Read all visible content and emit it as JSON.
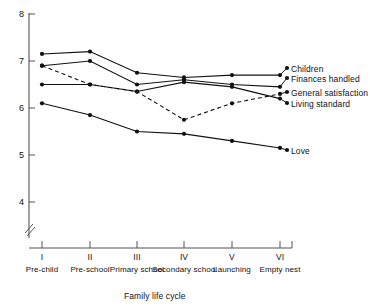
{
  "chart_data": {
    "type": "line",
    "title": "",
    "xlabel": "Family life cycle",
    "ylabel": "",
    "grid": false,
    "legend_position": "right-inline",
    "ylim": [
      3.7,
      8.1
    ],
    "yticks": [
      "8",
      "7",
      "6",
      "5",
      "4"
    ],
    "ytick_values": [
      8,
      7,
      6,
      5,
      4
    ],
    "y_axis_break": true,
    "x_axis_break": true,
    "categories": [
      "I",
      "II",
      "III",
      "IV",
      "V",
      "VI"
    ],
    "category_labels": [
      "Pre-child",
      "Pre-school",
      "Primary school",
      "Secondary school",
      "Launching",
      "Empty nest"
    ],
    "series": [
      {
        "name": "Children",
        "style": "solid",
        "values": [
          7.15,
          7.2,
          6.75,
          6.65,
          6.7,
          6.7
        ]
      },
      {
        "name": "Finances handled",
        "style": "solid",
        "values": [
          6.9,
          7.0,
          6.5,
          6.6,
          6.5,
          6.45
        ]
      },
      {
        "name": "Living standard",
        "style": "solid",
        "values": [
          6.5,
          6.5,
          6.35,
          6.55,
          6.45,
          6.2
        ]
      },
      {
        "name": "General satisfaction",
        "style": "dashed",
        "values": [
          6.9,
          6.5,
          6.35,
          5.75,
          6.1,
          6.3
        ]
      },
      {
        "name": "Love",
        "style": "solid",
        "values": [
          6.1,
          5.85,
          5.5,
          5.45,
          5.3,
          5.15
        ]
      }
    ],
    "legend_entries": [
      "Children",
      "Finances handled",
      "General satisfaction",
      "Living standard",
      "Love"
    ],
    "colors": {
      "line": "#111111",
      "axis": "#555555",
      "marker": "#111111"
    }
  }
}
